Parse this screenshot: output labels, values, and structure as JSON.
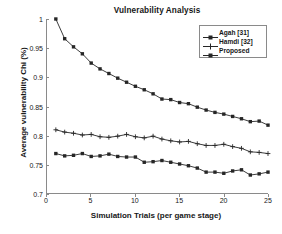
{
  "chart_data": {
    "type": "line",
    "title": "Vulnerability Analysis",
    "xlabel": "Simulation Trials (per game stage)",
    "ylabel": "Average vulnerability Chi (%)",
    "xlim": [
      0,
      25
    ],
    "ylim": [
      0.7,
      1
    ],
    "xticks": [
      0,
      5,
      10,
      15,
      20,
      25
    ],
    "yticks": [
      0.7,
      0.75,
      0.8,
      0.85,
      0.9,
      0.95,
      1
    ],
    "xtick_labels": [
      "0",
      "5",
      "10",
      "15",
      "20",
      "25"
    ],
    "ytick_labels": [
      "0.7",
      "0.75",
      "0.8",
      "0.85",
      "0.9",
      "0.95",
      "1"
    ],
    "grid": false,
    "legend_position": "top-right",
    "x": [
      1,
      2,
      3,
      4,
      5,
      6,
      7,
      8,
      9,
      10,
      11,
      12,
      13,
      14,
      15,
      16,
      17,
      18,
      19,
      20,
      21,
      22,
      23,
      24,
      25
    ],
    "series": [
      {
        "name": "Agah [31]",
        "marker": "square",
        "color": "#262626",
        "values": [
          1.0,
          0.966,
          0.952,
          0.94,
          0.924,
          0.914,
          0.906,
          0.898,
          0.891,
          0.884,
          0.878,
          0.871,
          0.862,
          0.861,
          0.856,
          0.854,
          0.848,
          0.843,
          0.839,
          0.836,
          0.832,
          0.828,
          0.823,
          0.824,
          0.817
        ]
      },
      {
        "name": "Hamdi [32]",
        "marker": "plus",
        "color": "#262626",
        "values": [
          0.809,
          0.805,
          0.803,
          0.8,
          0.801,
          0.797,
          0.796,
          0.798,
          0.801,
          0.797,
          0.795,
          0.798,
          0.793,
          0.79,
          0.788,
          0.789,
          0.785,
          0.782,
          0.782,
          0.784,
          0.78,
          0.777,
          0.771,
          0.77,
          0.768
        ]
      },
      {
        "name": "Proposed",
        "marker": "square",
        "color": "#262626",
        "values": [
          0.768,
          0.764,
          0.765,
          0.768,
          0.763,
          0.764,
          0.767,
          0.763,
          0.762,
          0.762,
          0.753,
          0.754,
          0.756,
          0.753,
          0.75,
          0.747,
          0.743,
          0.736,
          0.736,
          0.734,
          0.738,
          0.74,
          0.731,
          0.733,
          0.736
        ]
      }
    ]
  },
  "legend": {
    "items": [
      {
        "label": "Agah [31]"
      },
      {
        "label": "Hamdi [32]"
      },
      {
        "label": "Proposed"
      }
    ]
  }
}
